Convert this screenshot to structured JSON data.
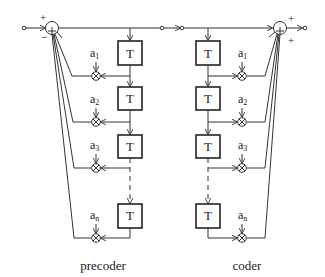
{
  "diagram": {
    "precoder": {
      "caption": "precoder",
      "summer": {
        "input_sign": "+",
        "feedback_sign": "−",
        "symbol": "+"
      },
      "delay_label": "T",
      "coefficients": [
        "a",
        "a",
        "a",
        "a"
      ],
      "coefficient_subscripts": [
        "1",
        "2",
        "3",
        "n"
      ]
    },
    "coder": {
      "caption": "coder",
      "summer": {
        "input_sign": "+",
        "feedback_sign": "+",
        "symbol": "+"
      },
      "delay_label": "T",
      "coefficients": [
        "a",
        "a",
        "a",
        "a"
      ],
      "coefficient_subscripts": [
        "1",
        "2",
        "3",
        "n"
      ]
    }
  }
}
